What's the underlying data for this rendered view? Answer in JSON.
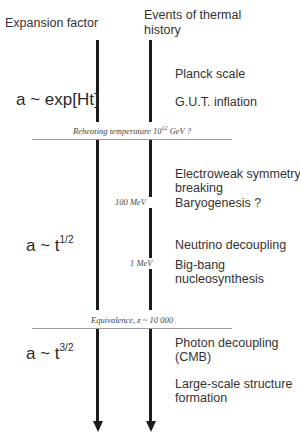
{
  "headers": {
    "left": "Expansion factor",
    "right_line1": "Events of thermal",
    "right_line2": "history"
  },
  "expansion_laws": [
    {
      "base": "a ~ exp[Ht]",
      "exponent": ""
    },
    {
      "base": "a ~ t",
      "exponent": "1/2"
    },
    {
      "base": "a ~ t",
      "exponent": "3/2"
    }
  ],
  "boundaries": {
    "reheating": {
      "text": "Reheating temperature 10",
      "exponent": "12",
      "suffix": " GeV ?"
    },
    "equivalence": {
      "text": "Equivalence, z ~ 10 000"
    }
  },
  "energy_marks": {
    "mark_100mev": "100 MeV",
    "mark_1mev": "1 MeV"
  },
  "events": {
    "planck": "Planck scale",
    "gut": "G.U.T. inflation",
    "electroweak_line1": "Electroweak symmetry",
    "electroweak_line2": "breaking",
    "baryogenesis": "Baryogenesis ?",
    "neutrino": "Neutrino decoupling",
    "bbn_line1": "Big-bang",
    "bbn_line2": "nucleosynthesis",
    "photon_line1": "Photon decoupling",
    "photon_line2": "(CMB)",
    "lss_line1": "Large-scale structure",
    "lss_line2": "formation"
  },
  "colors": {
    "axis": "#1c1c1c",
    "separator": "#9a9a9a",
    "text": "#333333"
  }
}
